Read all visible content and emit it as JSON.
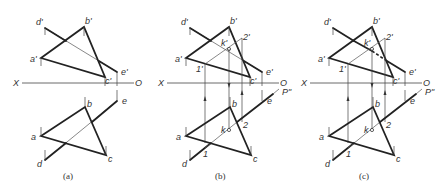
{
  "figure": {
    "panels": [
      {
        "id": "a",
        "caption": "(a)",
        "offset_x": 0,
        "labels": {
          "d_prime": "d'",
          "b_prime": "b'",
          "a_prime": "a'",
          "c_prime": "c'",
          "e_prime": "e'",
          "X": "X",
          "O": "O",
          "a": "a",
          "b": "b",
          "c": "c",
          "d": "d",
          "e": "e"
        }
      },
      {
        "id": "b",
        "caption": "(b)",
        "offset_x": 145,
        "labels": {
          "d_prime": "d'",
          "b_prime": "b'",
          "a_prime": "a'",
          "c_prime": "c'",
          "e_prime": "e'",
          "k_prime": "k'",
          "one_prime": "1'",
          "two_prime": "2'",
          "X": "X",
          "O": "O",
          "P": "P\"",
          "a": "a",
          "b": "b",
          "c": "c",
          "d": "d",
          "e": "e",
          "k": "k",
          "one": "1",
          "two": "2"
        }
      },
      {
        "id": "c",
        "caption": "(c)",
        "offset_x": 288,
        "labels": {
          "d_prime": "d'",
          "b_prime": "b'",
          "a_prime": "a'",
          "c_prime": "c'",
          "e_prime": "e'",
          "k_prime": "k'",
          "one_prime": "1'",
          "two_prime": "2'",
          "X": "X",
          "O": "O",
          "P": "P\"",
          "a": "a",
          "b": "b",
          "c": "c",
          "d": "d",
          "e": "e",
          "k": "k",
          "one": "1",
          "two": "2"
        }
      }
    ]
  }
}
